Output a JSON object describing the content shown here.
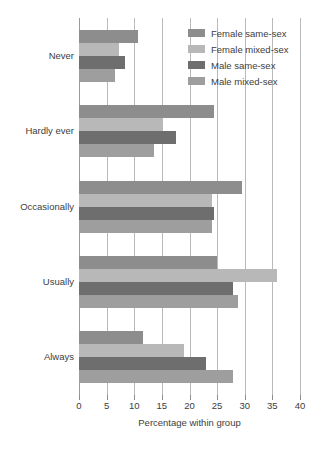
{
  "chart_data": {
    "type": "bar",
    "orientation": "horizontal",
    "title": "",
    "xlabel": "Percentage within group",
    "ylabel": "",
    "xlim": [
      0,
      40
    ],
    "xticks": [
      0,
      5,
      10,
      15,
      20,
      25,
      30,
      35,
      40
    ],
    "grid": true,
    "legend_position": "top-right",
    "categories": [
      "Never",
      "Hardly ever",
      "Occasionally",
      "Usually",
      "Always"
    ],
    "series": [
      {
        "name": "Female same-sex",
        "color": "#8d8d8d",
        "values": [
          10.7,
          24.5,
          29.5,
          25.0,
          11.5
        ]
      },
      {
        "name": "Female mixed-sex",
        "color": "#b8b8b8",
        "values": [
          7.2,
          15.0,
          24.0,
          35.8,
          19.0
        ]
      },
      {
        "name": "Male same-sex",
        "color": "#6e6e6e",
        "values": [
          8.3,
          17.5,
          24.5,
          27.8,
          23.0
        ]
      },
      {
        "name": "Male mixed-sex",
        "color": "#9e9e9e",
        "values": [
          6.5,
          13.5,
          24.0,
          28.7,
          27.8
        ]
      }
    ]
  },
  "axis": {
    "x_title": "Percentage within group",
    "tick_labels": [
      "0",
      "5",
      "10",
      "15",
      "20",
      "25",
      "30",
      "35",
      "40"
    ]
  },
  "categories": [
    {
      "label": "Never"
    },
    {
      "label": "Hardly ever"
    },
    {
      "label": "Occasionally"
    },
    {
      "label": "Usually"
    },
    {
      "label": "Always"
    }
  ],
  "legend": {
    "items": [
      {
        "label": "Female same-sex",
        "color": "#8d8d8d"
      },
      {
        "label": "Female mixed-sex",
        "color": "#b8b8b8"
      },
      {
        "label": "Male same-sex",
        "color": "#6e6e6e"
      },
      {
        "label": "Male mixed-sex",
        "color": "#9e9e9e"
      }
    ]
  },
  "colors": {
    "gridline": "#b9b9b9",
    "axis": "#9a9a9a",
    "text": "#3d3d3d",
    "background": "#ffffff"
  }
}
